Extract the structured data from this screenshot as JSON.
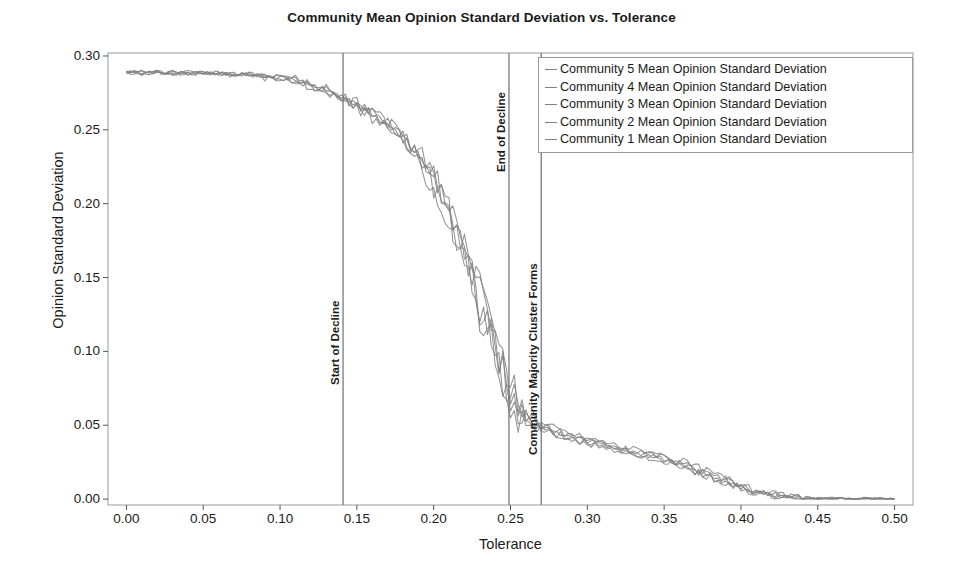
{
  "chart_data": {
    "type": "line",
    "title": "Community Mean Opinion Standard Deviation vs. Tolerance",
    "xlabel": "Tolerance",
    "ylabel": "Opinion Standard Deviation",
    "xlim": [
      -0.012,
      0.512
    ],
    "ylim": [
      -0.004,
      0.302
    ],
    "xticks": [
      "0.00",
      "0.05",
      "0.10",
      "0.15",
      "0.20",
      "0.25",
      "0.30",
      "0.35",
      "0.40",
      "0.45",
      "0.50"
    ],
    "xtick_values": [
      0.0,
      0.05,
      0.1,
      0.15,
      0.2,
      0.25,
      0.3,
      0.35,
      0.4,
      0.45,
      0.5
    ],
    "yticks": [
      "0.00",
      "0.05",
      "0.10",
      "0.15",
      "0.20",
      "0.25",
      "0.30"
    ],
    "ytick_values": [
      0.0,
      0.05,
      0.1,
      0.15,
      0.2,
      0.25,
      0.3
    ],
    "grid": false,
    "legend_position": "top-right",
    "line_color": "#808080",
    "frame_color": "#9a9a9a",
    "x": [
      0.0,
      0.01,
      0.02,
      0.03,
      0.04,
      0.05,
      0.06,
      0.07,
      0.08,
      0.09,
      0.1,
      0.11,
      0.12,
      0.13,
      0.14,
      0.15,
      0.16,
      0.17,
      0.18,
      0.19,
      0.2,
      0.21,
      0.22,
      0.23,
      0.24,
      0.25,
      0.26,
      0.27,
      0.28,
      0.29,
      0.3,
      0.31,
      0.32,
      0.33,
      0.34,
      0.35,
      0.36,
      0.37,
      0.38,
      0.39,
      0.4,
      0.41,
      0.42,
      0.43,
      0.44,
      0.45,
      0.46,
      0.47,
      0.48,
      0.49,
      0.5
    ],
    "series": [
      {
        "name": "Community 5 Mean Opinion Standard Deviation",
        "color": "#808080",
        "values": [
          0.289,
          0.289,
          0.289,
          0.288,
          0.289,
          0.288,
          0.289,
          0.288,
          0.288,
          0.287,
          0.286,
          0.284,
          0.281,
          0.277,
          0.272,
          0.268,
          0.262,
          0.255,
          0.246,
          0.235,
          0.219,
          0.196,
          0.168,
          0.138,
          0.108,
          0.078,
          0.058,
          0.05,
          0.046,
          0.043,
          0.04,
          0.038,
          0.035,
          0.033,
          0.031,
          0.028,
          0.025,
          0.021,
          0.017,
          0.013,
          0.009,
          0.006,
          0.004,
          0.002,
          0.001,
          0.0,
          0.0,
          0.0,
          0.0,
          0.0,
          0.0
        ]
      },
      {
        "name": "Community 4 Mean Opinion Standard Deviation",
        "color": "#808080",
        "values": [
          0.289,
          0.289,
          0.288,
          0.289,
          0.288,
          0.289,
          0.288,
          0.288,
          0.287,
          0.287,
          0.285,
          0.283,
          0.28,
          0.276,
          0.273,
          0.266,
          0.26,
          0.253,
          0.245,
          0.232,
          0.216,
          0.193,
          0.166,
          0.141,
          0.112,
          0.072,
          0.055,
          0.049,
          0.045,
          0.042,
          0.04,
          0.037,
          0.035,
          0.032,
          0.03,
          0.027,
          0.024,
          0.02,
          0.016,
          0.012,
          0.008,
          0.005,
          0.003,
          0.002,
          0.001,
          0.0,
          0.0,
          0.0,
          0.0,
          0.0,
          0.0
        ]
      },
      {
        "name": "Community 3 Mean Opinion Standard Deviation",
        "color": "#808080",
        "values": [
          0.289,
          0.288,
          0.289,
          0.289,
          0.288,
          0.288,
          0.289,
          0.287,
          0.288,
          0.286,
          0.285,
          0.284,
          0.279,
          0.278,
          0.271,
          0.267,
          0.261,
          0.254,
          0.244,
          0.236,
          0.221,
          0.198,
          0.172,
          0.135,
          0.104,
          0.068,
          0.056,
          0.051,
          0.047,
          0.044,
          0.041,
          0.039,
          0.036,
          0.034,
          0.032,
          0.029,
          0.026,
          0.022,
          0.018,
          0.014,
          0.01,
          0.006,
          0.004,
          0.002,
          0.001,
          0.0,
          0.0,
          0.0,
          0.0,
          0.0,
          0.0
        ]
      },
      {
        "name": "Community 2 Mean Opinion Standard Deviation",
        "color": "#808080",
        "values": [
          0.289,
          0.289,
          0.289,
          0.288,
          0.289,
          0.288,
          0.288,
          0.288,
          0.287,
          0.286,
          0.286,
          0.282,
          0.282,
          0.275,
          0.274,
          0.264,
          0.259,
          0.256,
          0.243,
          0.23,
          0.213,
          0.191,
          0.162,
          0.13,
          0.1,
          0.064,
          0.053,
          0.048,
          0.044,
          0.041,
          0.038,
          0.036,
          0.034,
          0.031,
          0.029,
          0.026,
          0.023,
          0.019,
          0.015,
          0.011,
          0.007,
          0.005,
          0.003,
          0.001,
          0.001,
          0.0,
          0.0,
          0.0,
          0.0,
          0.0,
          0.0
        ]
      },
      {
        "name": "Community 1 Mean Opinion Standard Deviation",
        "color": "#808080",
        "values": [
          0.289,
          0.288,
          0.289,
          0.288,
          0.288,
          0.289,
          0.288,
          0.287,
          0.288,
          0.285,
          0.284,
          0.285,
          0.278,
          0.279,
          0.269,
          0.269,
          0.258,
          0.251,
          0.248,
          0.228,
          0.21,
          0.188,
          0.176,
          0.127,
          0.096,
          0.06,
          0.051,
          0.047,
          0.043,
          0.04,
          0.037,
          0.035,
          0.033,
          0.03,
          0.028,
          0.025,
          0.022,
          0.018,
          0.014,
          0.01,
          0.007,
          0.004,
          0.002,
          0.001,
          0.0,
          0.0,
          0.0,
          0.0,
          0.0,
          0.0,
          0.0
        ]
      }
    ],
    "annotations": [
      {
        "label": "Start of Decline",
        "x": 0.141,
        "color": "#6e6e6e"
      },
      {
        "label": "End of Decline",
        "x": 0.249,
        "color": "#6e6e6e"
      },
      {
        "label": "Community Majority Cluster Forms",
        "x": 0.27,
        "color": "#6e6e6e"
      }
    ]
  }
}
